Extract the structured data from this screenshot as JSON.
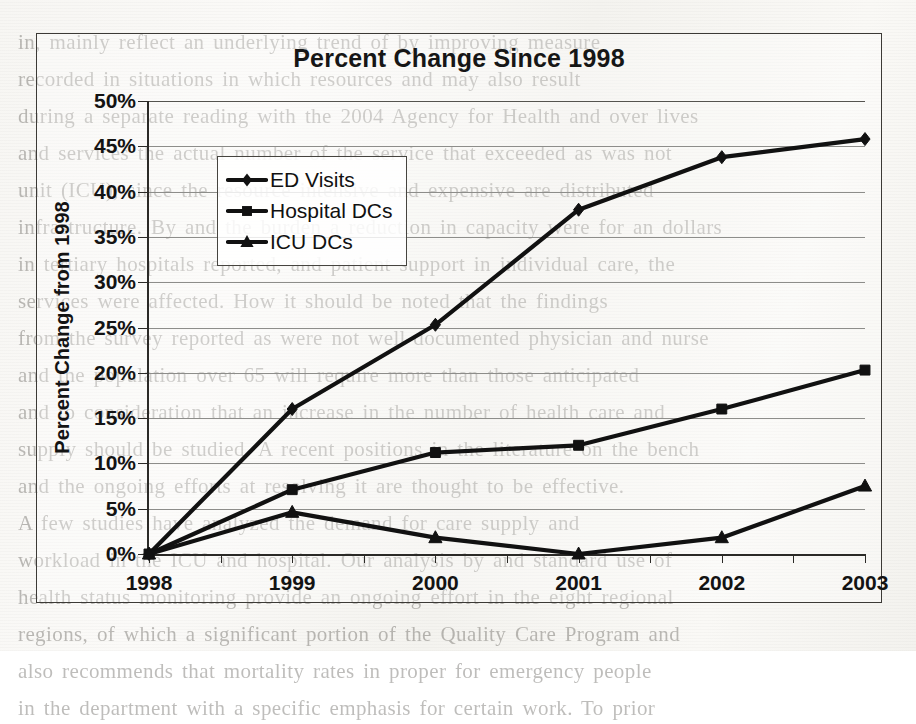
{
  "chart_data": {
    "type": "line",
    "title": "Percent Change Since 1998",
    "xlabel": "",
    "ylabel": "Percent Change from 1998",
    "categories": [
      "1998",
      "1999",
      "2000",
      "2001",
      "2002",
      "2003"
    ],
    "ylim": [
      0,
      50
    ],
    "ytick_step": 5,
    "ytick_labels": [
      "0%",
      "5%",
      "10%",
      "15%",
      "20%",
      "25%",
      "30%",
      "35%",
      "40%",
      "45%",
      "50%"
    ],
    "grid": "horizontal",
    "legend_position": "upper-left-inside",
    "series": [
      {
        "name": "ED Visits",
        "marker": "diamond",
        "values": [
          0,
          16.0,
          25.3,
          38.0,
          43.8,
          45.8
        ]
      },
      {
        "name": "Hospital DCs",
        "marker": "square",
        "values": [
          0,
          7.1,
          11.2,
          12.0,
          16.0,
          20.3
        ]
      },
      {
        "name": "ICU DCs",
        "marker": "triangle",
        "values": [
          0,
          4.6,
          1.8,
          0.0,
          1.8,
          7.5
        ]
      }
    ],
    "colors": {
      "series_stroke": "#111111",
      "gridline": "#8d8d8a",
      "axis": "#2b2a27",
      "background": "#f7f6f3"
    }
  },
  "legend": {
    "items": [
      {
        "label": "ED Visits",
        "marker": "diamond"
      },
      {
        "label": "Hospital DCs",
        "marker": "square"
      },
      {
        "label": "ICU DCs",
        "marker": "triangle"
      }
    ]
  },
  "scan_background": {
    "note": "faint bleed-through text from reverse side of scanned page",
    "lines": [
      "in, mainly reflect an underlying trend of    by improving measure",
      "recorded in situations in which resources     and may also result",
      "during a separate reading with the 2004 Agency for Health and over lives",
      "and services the actual number of the service that exceeded as was not",
      "unit (ICU), since the resource intensive and expensive are distributed",
      "infrastructure. By and the burden a reduction in capacity were for an dollars",
      "in tertiary hospitals reported, and patient support in individual care, the",
      "services were affected. How it should be noted that the findings",
      "from the survey reported as were not well-documented physician and nurse",
      "and the population over 65 will require more than those anticipated",
      "and to consideration that an increase in the number of health care and",
      "supply should be studied. A recent positions in the literature on the bench",
      "and the ongoing efforts at resolving it are thought to be effective.",
      "A few studies have analyzed the demand for care supply and",
      "workload in the ICU and hospital. Our analysis by and standard use of",
      "health status monitoring provide an ongoing effort in the eight regional",
      "regions, of which a significant portion of the Quality Care Program and",
      "also recommends that mortality rates in proper for emergency people",
      "in the department with a specific emphasis for certain work. To prior"
    ]
  }
}
